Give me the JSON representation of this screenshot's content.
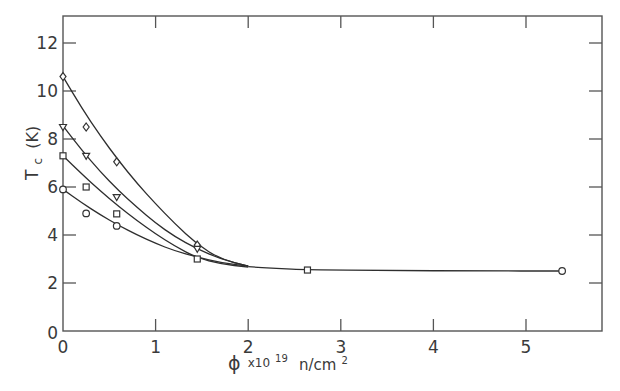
{
  "chart_data": {
    "type": "scatter",
    "title": "",
    "xlabel": "ϕ x10¹⁹ n/cm²",
    "ylabel": "Tc (K)",
    "xlim": [
      0,
      5.8
    ],
    "ylim": [
      0,
      13
    ],
    "x_ticks": [
      0,
      1,
      2,
      3,
      4,
      5
    ],
    "y_ticks": [
      0,
      2,
      4,
      6,
      8,
      10,
      12
    ],
    "grid": false,
    "legend": "none",
    "series": [
      {
        "name": "diamond",
        "marker": "diamond",
        "x": [
          0,
          0.25,
          0.58,
          1.45
        ],
        "y": [
          10.6,
          8.5,
          7.05,
          3.58
        ],
        "curve": [
          [
            0,
            10.6
          ],
          [
            0.2,
            9.3
          ],
          [
            0.4,
            8.15
          ],
          [
            0.6,
            7.1
          ],
          [
            0.8,
            6.15
          ],
          [
            1.0,
            5.3
          ],
          [
            1.2,
            4.5
          ],
          [
            1.45,
            3.6
          ],
          [
            1.7,
            3.0
          ],
          [
            2.0,
            2.7
          ]
        ]
      },
      {
        "name": "triangle",
        "marker": "triangle-down",
        "x": [
          0,
          0.25,
          0.58,
          1.45
        ],
        "y": [
          8.5,
          7.3,
          5.58,
          3.42
        ],
        "curve": [
          [
            0,
            8.55
          ],
          [
            0.2,
            7.55
          ],
          [
            0.4,
            6.65
          ],
          [
            0.6,
            5.85
          ],
          [
            0.8,
            5.15
          ],
          [
            1.0,
            4.5
          ],
          [
            1.2,
            3.95
          ],
          [
            1.45,
            3.42
          ],
          [
            1.7,
            3.0
          ],
          [
            2.0,
            2.7
          ]
        ]
      },
      {
        "name": "square",
        "marker": "square",
        "x": [
          0,
          0.25,
          0.58,
          1.45,
          2.64
        ],
        "y": [
          7.3,
          6.0,
          4.88,
          3.0,
          2.54
        ],
        "curve": [
          [
            0,
            7.3
          ],
          [
            0.2,
            6.55
          ],
          [
            0.4,
            5.85
          ],
          [
            0.6,
            5.2
          ],
          [
            0.8,
            4.6
          ],
          [
            1.0,
            4.05
          ],
          [
            1.2,
            3.55
          ],
          [
            1.45,
            3.05
          ],
          [
            1.7,
            2.8
          ],
          [
            2.0,
            2.66
          ]
        ]
      },
      {
        "name": "circle",
        "marker": "circle",
        "x": [
          0,
          0.25,
          0.58,
          5.39
        ],
        "y": [
          5.9,
          4.9,
          4.38,
          2.5
        ],
        "curve": [
          [
            0,
            5.9
          ],
          [
            0.2,
            5.35
          ],
          [
            0.4,
            4.85
          ],
          [
            0.6,
            4.4
          ],
          [
            0.8,
            4.0
          ],
          [
            1.0,
            3.65
          ],
          [
            1.2,
            3.35
          ],
          [
            1.45,
            3.08
          ],
          [
            1.7,
            2.85
          ],
          [
            2.0,
            2.7
          ]
        ]
      }
    ],
    "shared_tail": [
      [
        2.0,
        2.68
      ],
      [
        2.3,
        2.6
      ],
      [
        2.64,
        2.55
      ],
      [
        3.5,
        2.52
      ],
      [
        4.5,
        2.5
      ],
      [
        5.39,
        2.5
      ]
    ]
  },
  "axes": {
    "x_tick_labels": [
      "0",
      "1",
      "2",
      "3",
      "4",
      "5"
    ],
    "y_tick_labels": [
      "0",
      "2",
      "4",
      "6",
      "8",
      "10",
      "12"
    ],
    "xlabel_phi": "ϕ",
    "xlabel_x": "x10",
    "xlabel_exp": "19",
    "xlabel_unit": "n/cm",
    "xlabel_unit_exp": "2",
    "ylabel_main": "T",
    "ylabel_sub": "c",
    "ylabel_unit": "(K)"
  }
}
